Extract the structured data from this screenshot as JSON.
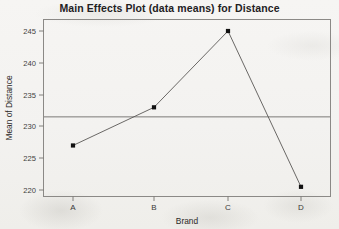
{
  "chart_data": {
    "type": "line",
    "title": "Main Effects Plot (data means) for Distance",
    "xlabel": "Brand",
    "ylabel": "Mean of Distance",
    "categories": [
      "A",
      "B",
      "C",
      "D"
    ],
    "values": [
      227,
      233,
      245,
      220.5
    ],
    "series": [
      {
        "name": "Mean of Distance",
        "values": [
          227,
          233,
          245,
          220.5
        ]
      }
    ],
    "ylim": [
      218.5,
      246.5
    ],
    "yticks": [
      220,
      225,
      230,
      235,
      240,
      245
    ],
    "ytick_labels": [
      "220",
      "225",
      "230",
      "235",
      "240",
      "245"
    ],
    "xticks": [
      "A",
      "B",
      "C",
      "D"
    ],
    "grid": false,
    "legend": null,
    "reference_line": {
      "label": "grand mean",
      "value": 231.5,
      "orientation": "horizontal"
    },
    "marker": "filled-square",
    "marker_color": "#111111",
    "line_color": "#5a5856",
    "frame_color": "#8b8986",
    "background_color": "#f4f3f1"
  }
}
